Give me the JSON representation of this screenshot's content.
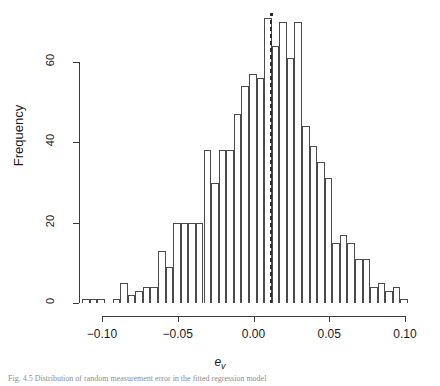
{
  "figure": {
    "caption": "Fig. 4.5  Distribution of random measurement error in the fitted regression model",
    "background_color": "#ffffff",
    "axis_color": "#3a3a3a",
    "bar_edge_color": "#4a4a4a",
    "bar_fill_color": "#ffffff",
    "reference_line_color": "#2b2b2b"
  },
  "axes": {
    "y_title": "Frequency",
    "x_title_base": "e",
    "x_title_sub": "v",
    "y_ticks": [
      "0",
      "20",
      "40",
      "60"
    ],
    "x_ticks": [
      "-0.10",
      "-0.05",
      "0.00",
      "0.05",
      "0.10"
    ]
  },
  "chart_data": {
    "type": "bar",
    "title": "",
    "subtitle": "",
    "xlabel": "e_v",
    "ylabel": "Frequency",
    "xlim": [
      -0.113,
      0.103
    ],
    "ylim": [
      0,
      72
    ],
    "grid": false,
    "legend": "none",
    "bin_width": 0.005,
    "bin_starts": [
      -0.113,
      -0.108,
      -0.103,
      -0.098,
      -0.093,
      -0.088,
      -0.083,
      -0.078,
      -0.073,
      -0.068,
      -0.063,
      -0.058,
      -0.053,
      -0.048,
      -0.043,
      -0.038,
      -0.033,
      -0.028,
      -0.023,
      -0.018,
      -0.013,
      -0.008,
      -0.003,
      0.002,
      0.007,
      0.012,
      0.017,
      0.022,
      0.027,
      0.032,
      0.037,
      0.042,
      0.047,
      0.052,
      0.057,
      0.062,
      0.067,
      0.072,
      0.077,
      0.082,
      0.087,
      0.092,
      0.097
    ],
    "categories": [
      "-0.113",
      "-0.108",
      "-0.103",
      "-0.098",
      "-0.093",
      "-0.088",
      "-0.083",
      "-0.078",
      "-0.073",
      "-0.068",
      "-0.063",
      "-0.058",
      "-0.053",
      "-0.048",
      "-0.043",
      "-0.038",
      "-0.033",
      "-0.028",
      "-0.023",
      "-0.018",
      "-0.013",
      "-0.008",
      "-0.003",
      "0.002",
      "0.007",
      "0.012",
      "0.017",
      "0.022",
      "0.027",
      "0.032",
      "0.037",
      "0.042",
      "0.047",
      "0.052",
      "0.057",
      "0.062",
      "0.067",
      "0.072",
      "0.077",
      "0.082",
      "0.087",
      "0.092",
      "0.097"
    ],
    "values": [
      1,
      1,
      1,
      0,
      1,
      5,
      2,
      3,
      4,
      4,
      13,
      9,
      20,
      20,
      20,
      20,
      38,
      30,
      38,
      38,
      47,
      54,
      57,
      56,
      71,
      64,
      70,
      61,
      70,
      44,
      39,
      35,
      31,
      15,
      17,
      15,
      11,
      11,
      4,
      5,
      3,
      4,
      1
    ],
    "annotations": [
      {
        "name": "mean-reference-line",
        "style": "dotted-vertical",
        "x_value": 0.0113,
        "marker": "point-at-top",
        "marker_y": 72
      }
    ]
  }
}
